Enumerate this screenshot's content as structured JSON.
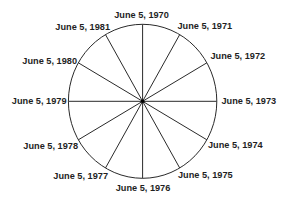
{
  "diagram": {
    "type": "clock-wheel",
    "labels": [
      "June 5, 1970",
      "June 5, 1971",
      "June 5, 1972",
      "June 5, 1973",
      "June 5, 1974",
      "June 5, 1975",
      "June 5, 1976",
      "June 5, 1977",
      "June 5, 1978",
      "June 5, 1979",
      "June 5, 1980",
      "June 5, 1981"
    ],
    "spoke_count": 12,
    "start_position": "top",
    "direction": "clockwise",
    "colors": {
      "line": "#2a2a2a",
      "text": "#1f1f1f",
      "background": "#ffffff"
    }
  }
}
